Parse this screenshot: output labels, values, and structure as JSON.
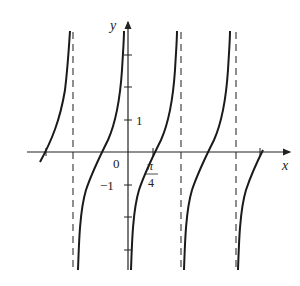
{
  "figure": {
    "axis_labels": {
      "x": "x",
      "y": "y"
    },
    "tick_labels": {
      "origin": "0",
      "y_pos": "1",
      "y_neg": "−1",
      "x_frac_num": "π",
      "x_frac_den": "4"
    },
    "colors": {
      "curve": "#1a1a1a",
      "axes": "#333333",
      "asymptote": "#444444"
    },
    "asymptotes_x_px": [
      73,
      181,
      234
    ],
    "zeros_x_px": [
      46,
      99,
      153,
      207,
      260
    ]
  }
}
